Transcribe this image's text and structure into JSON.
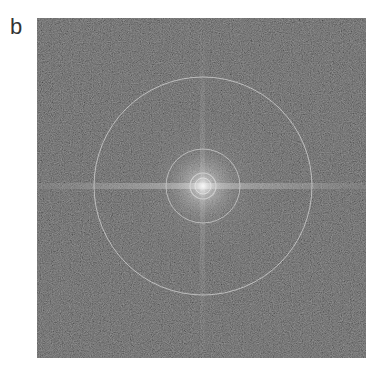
{
  "figure": {
    "panel_label": "b",
    "image_description": "Fourier power spectrum (noise pattern) with concentric rings and central bright spot, horizontal bright streak through center",
    "colors": {
      "background": "#2b2b2b",
      "ring": "#cfcfcf",
      "streak": "#bdbdbd"
    },
    "rings": [
      {
        "name": "inner-ring"
      },
      {
        "name": "middle-ring"
      },
      {
        "name": "outer-ring"
      }
    ]
  }
}
